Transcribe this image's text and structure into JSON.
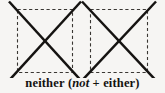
{
  "figure": {
    "shapes": [
      {
        "name": "left-crossed-square",
        "box": {
          "x": 17,
          "y": 9,
          "width": 56,
          "height": 64
        },
        "border_style": "dashed",
        "overlay": "x-cross",
        "cross_overshoot": 11
      },
      {
        "name": "right-crossed-square",
        "box": {
          "x": 90,
          "y": 9,
          "width": 58,
          "height": 64
        },
        "border_style": "dashed",
        "overlay": "x-cross",
        "cross_overshoot": 11
      }
    ],
    "colors": {
      "background": "#f6f5f3",
      "cross_stroke": "#151311",
      "dash_stroke": "#3a3733",
      "caption_text": "#141210"
    }
  },
  "caption": {
    "headword": "neither",
    "open_paren": "(",
    "italic_word": "not",
    "plus": "+",
    "second_word": "either",
    "close_paren": ")",
    "full_text": "neither (not + either)"
  }
}
